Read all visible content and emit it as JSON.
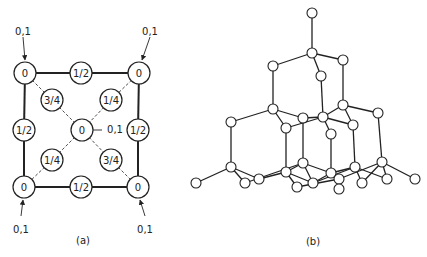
{
  "colors": {
    "stroke": "#222222",
    "fill": "#ffffff",
    "background": "#ffffff"
  },
  "panel_a": {
    "caption": "(a)",
    "nodes": [
      {
        "id": "tl",
        "label": "0",
        "x": 25,
        "y": 73
      },
      {
        "id": "tm",
        "label": "1/2",
        "x": 81,
        "y": 73
      },
      {
        "id": "tr",
        "label": "0",
        "x": 139,
        "y": 73
      },
      {
        "id": "ul",
        "label": "3/4",
        "x": 52,
        "y": 100
      },
      {
        "id": "ur",
        "label": "1/4",
        "x": 111,
        "y": 100
      },
      {
        "id": "ml",
        "label": "1/2",
        "x": 24,
        "y": 130
      },
      {
        "id": "c",
        "label": "0",
        "x": 82,
        "y": 130
      },
      {
        "id": "mr",
        "label": "1/2",
        "x": 138,
        "y": 130
      },
      {
        "id": "ll",
        "label": "1/4",
        "x": 52,
        "y": 160
      },
      {
        "id": "lr",
        "label": "3/4",
        "x": 111,
        "y": 160
      },
      {
        "id": "bl",
        "label": "0",
        "x": 24,
        "y": 187
      },
      {
        "id": "bm",
        "label": "1/2",
        "x": 81,
        "y": 187
      },
      {
        "id": "br",
        "label": "0",
        "x": 138,
        "y": 187
      }
    ],
    "solid_edges": [
      [
        "tl",
        "tm"
      ],
      [
        "tm",
        "tr"
      ],
      [
        "tl",
        "ml"
      ],
      [
        "ml",
        "bl"
      ],
      [
        "tr",
        "mr"
      ],
      [
        "mr",
        "br"
      ],
      [
        "bl",
        "bm"
      ],
      [
        "bm",
        "br"
      ]
    ],
    "dashed_edges": [
      [
        "tl",
        "ul"
      ],
      [
        "ul",
        "c"
      ],
      [
        "tr",
        "ur"
      ],
      [
        "ur",
        "c"
      ],
      [
        "c",
        "ll"
      ],
      [
        "ll",
        "bl"
      ],
      [
        "c",
        "lr"
      ],
      [
        "lr",
        "br"
      ]
    ],
    "annotations": [
      {
        "text": "0,1",
        "x": 23,
        "y": 31,
        "arrow": [
          23,
          37,
          25,
          60
        ]
      },
      {
        "text": "0,1",
        "x": 150,
        "y": 31,
        "arrow": [
          150,
          37,
          142,
          60
        ]
      },
      {
        "text": "0,1",
        "x": 115,
        "y": 129,
        "arrow": [
          102,
          130,
          93,
          130
        ],
        "leader_only": true
      },
      {
        "text": "0,1",
        "x": 21,
        "y": 229,
        "arrow": [
          21,
          216,
          23,
          200
        ]
      },
      {
        "text": "0,1",
        "x": 145,
        "y": 229,
        "arrow": [
          145,
          216,
          140,
          200
        ]
      }
    ]
  },
  "panel_b": {
    "caption": "(b)",
    "nodes": [
      {
        "id": "n1",
        "x": 312,
        "y": 13
      },
      {
        "id": "n2",
        "x": 312,
        "y": 53
      },
      {
        "id": "n3",
        "x": 273,
        "y": 66
      },
      {
        "id": "n4",
        "x": 343,
        "y": 60
      },
      {
        "id": "n5",
        "x": 321,
        "y": 76
      },
      {
        "id": "n6",
        "x": 273,
        "y": 109
      },
      {
        "id": "n7",
        "x": 231,
        "y": 122
      },
      {
        "id": "n8",
        "x": 286,
        "y": 128
      },
      {
        "id": "n9",
        "x": 303,
        "y": 118
      },
      {
        "id": "n10",
        "x": 323,
        "y": 117
      },
      {
        "id": "n11",
        "x": 343,
        "y": 105
      },
      {
        "id": "n12",
        "x": 378,
        "y": 113
      },
      {
        "id": "n13",
        "x": 353,
        "y": 125
      },
      {
        "id": "n14",
        "x": 331,
        "y": 134
      },
      {
        "id": "n15",
        "x": 231,
        "y": 167
      },
      {
        "id": "n16",
        "x": 196,
        "y": 183
      },
      {
        "id": "n17",
        "x": 245,
        "y": 183
      },
      {
        "id": "n18",
        "x": 259,
        "y": 179
      },
      {
        "id": "n19",
        "x": 286,
        "y": 172
      },
      {
        "id": "n20",
        "x": 303,
        "y": 163
      },
      {
        "id": "n21",
        "x": 297,
        "y": 187
      },
      {
        "id": "n22",
        "x": 313,
        "y": 183
      },
      {
        "id": "n23",
        "x": 331,
        "y": 173
      },
      {
        "id": "n24",
        "x": 339,
        "y": 179
      },
      {
        "id": "n25",
        "x": 339,
        "y": 189
      },
      {
        "id": "n26",
        "x": 355,
        "y": 167
      },
      {
        "id": "n27",
        "x": 362,
        "y": 183
      },
      {
        "id": "n28",
        "x": 382,
        "y": 162
      },
      {
        "id": "n29",
        "x": 387,
        "y": 179
      },
      {
        "id": "n30",
        "x": 415,
        "y": 179
      }
    ],
    "edges": [
      [
        "n1",
        "n2"
      ],
      [
        "n2",
        "n3"
      ],
      [
        "n2",
        "n4"
      ],
      [
        "n2",
        "n5"
      ],
      [
        "n3",
        "n6"
      ],
      [
        "n4",
        "n11"
      ],
      [
        "n5",
        "n10"
      ],
      [
        "n6",
        "n7"
      ],
      [
        "n6",
        "n8"
      ],
      [
        "n6",
        "n9"
      ],
      [
        "n8",
        "n10"
      ],
      [
        "n9",
        "n10"
      ],
      [
        "n10",
        "n11"
      ],
      [
        "n10",
        "n14"
      ],
      [
        "n10",
        "n13"
      ],
      [
        "n11",
        "n12"
      ],
      [
        "n11",
        "n13"
      ],
      [
        "n7",
        "n15"
      ],
      [
        "n8",
        "n19"
      ],
      [
        "n9",
        "n20"
      ],
      [
        "n14",
        "n23"
      ],
      [
        "n13",
        "n26"
      ],
      [
        "n12",
        "n28"
      ],
      [
        "n15",
        "n16"
      ],
      [
        "n15",
        "n17"
      ],
      [
        "n15",
        "n18"
      ],
      [
        "n18",
        "n19"
      ],
      [
        "n17",
        "n20"
      ],
      [
        "n19",
        "n21"
      ],
      [
        "n19",
        "n20"
      ],
      [
        "n19",
        "n22"
      ],
      [
        "n20",
        "n22"
      ],
      [
        "n20",
        "n23"
      ],
      [
        "n22",
        "n23"
      ],
      [
        "n21",
        "n24"
      ],
      [
        "n23",
        "n24"
      ],
      [
        "n23",
        "n26"
      ],
      [
        "n24",
        "n25"
      ],
      [
        "n24",
        "n28"
      ],
      [
        "n22",
        "n26"
      ],
      [
        "n26",
        "n27"
      ],
      [
        "n26",
        "n29"
      ],
      [
        "n28",
        "n29"
      ],
      [
        "n28",
        "n30"
      ],
      [
        "n27",
        "n28"
      ]
    ]
  }
}
